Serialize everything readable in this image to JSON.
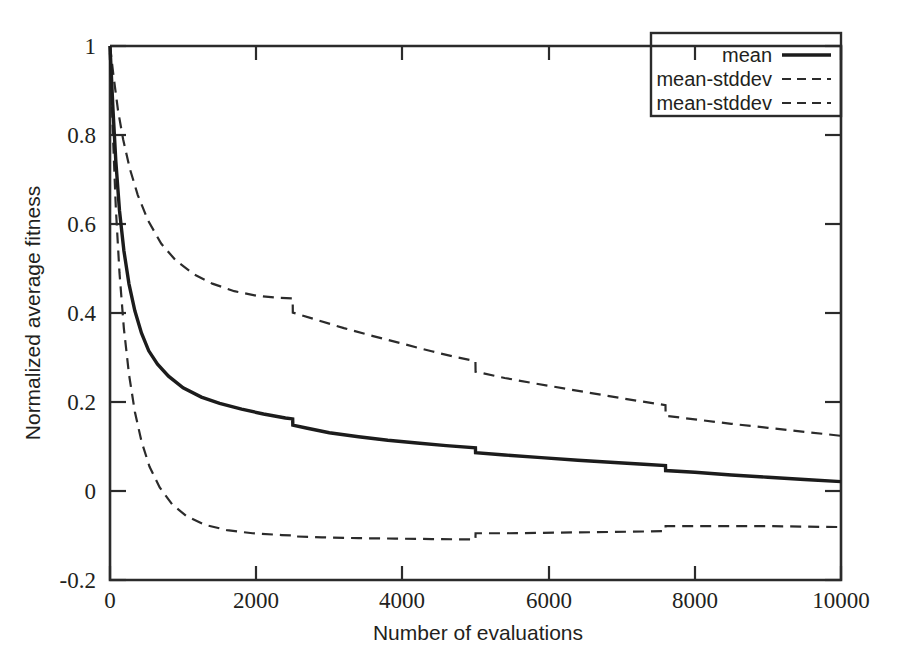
{
  "chart_data": {
    "type": "line",
    "title": "",
    "xlabel": "Number of evaluations",
    "ylabel": "Normalized  average fitness",
    "xlim": [
      0,
      10000
    ],
    "ylim": [
      -0.2,
      1
    ],
    "xticks": [
      0,
      2000,
      4000,
      6000,
      8000,
      10000
    ],
    "xtick_labels": [
      "0",
      "2000",
      "4000",
      "6000",
      "8000",
      "10000"
    ],
    "yticks": [
      -0.2,
      0,
      0.2,
      0.4,
      0.6,
      0.8,
      1
    ],
    "ytick_labels": [
      "-0.2",
      "0",
      "0.2",
      "0.4",
      "0.6",
      "0.8",
      "1"
    ],
    "grid": false,
    "legend_position": "top-right",
    "legend": [
      "mean",
      "mean-stddev",
      "mean-stddev"
    ],
    "series": [
      {
        "name": "mean",
        "style": "solid",
        "x": [
          0,
          40,
          80,
          130,
          190,
          260,
          340,
          430,
          530,
          650,
          800,
          1000,
          1250,
          1500,
          1800,
          2100,
          2400,
          2499,
          2501,
          2700,
          3000,
          3400,
          3800,
          4200,
          4600,
          4999,
          5001,
          5400,
          5900,
          6400,
          6900,
          7300,
          7599,
          7601,
          8000,
          8500,
          9000,
          9500,
          10000
        ],
        "y": [
          1.0,
          0.86,
          0.74,
          0.63,
          0.54,
          0.465,
          0.405,
          0.355,
          0.315,
          0.285,
          0.258,
          0.232,
          0.211,
          0.197,
          0.184,
          0.173,
          0.164,
          0.162,
          0.148,
          0.141,
          0.131,
          0.122,
          0.114,
          0.108,
          0.102,
          0.097,
          0.086,
          0.081,
          0.075,
          0.069,
          0.064,
          0.06,
          0.057,
          0.046,
          0.042,
          0.036,
          0.031,
          0.026,
          0.021
        ]
      },
      {
        "name": "mean-stddev",
        "style": "dashed",
        "x": [
          0,
          50,
          110,
          180,
          270,
          380,
          520,
          700,
          900,
          1150,
          1400,
          1700,
          2000,
          2300,
          2499,
          2501,
          2800,
          3200,
          3600,
          4000,
          4400,
          4700,
          4999,
          5001,
          5400,
          5800,
          6300,
          6800,
          7200,
          7599,
          7601,
          8000,
          8500,
          9000,
          9500,
          10000
        ],
        "y": [
          1.0,
          0.93,
          0.855,
          0.79,
          0.725,
          0.665,
          0.608,
          0.556,
          0.518,
          0.487,
          0.466,
          0.449,
          0.439,
          0.434,
          0.433,
          0.401,
          0.386,
          0.366,
          0.348,
          0.331,
          0.314,
          0.302,
          0.292,
          0.268,
          0.254,
          0.242,
          0.228,
          0.214,
          0.203,
          0.193,
          0.169,
          0.161,
          0.151,
          0.142,
          0.133,
          0.124
        ]
      },
      {
        "name": "mean-stddev",
        "style": "dashed",
        "x": [
          0,
          40,
          80,
          130,
          190,
          260,
          340,
          430,
          540,
          680,
          850,
          1050,
          1300,
          1600,
          1950,
          2350,
          2499,
          2501,
          2900,
          3400,
          3900,
          4400,
          4999,
          5001,
          5400,
          5900,
          6400,
          6900,
          7300,
          7599,
          7601,
          8000,
          8500,
          9000,
          9500,
          10000
        ],
        "y": [
          0.985,
          0.8,
          0.635,
          0.49,
          0.365,
          0.262,
          0.178,
          0.112,
          0.055,
          0.008,
          -0.03,
          -0.057,
          -0.076,
          -0.088,
          -0.095,
          -0.099,
          -0.1,
          -0.102,
          -0.104,
          -0.106,
          -0.107,
          -0.108,
          -0.109,
          -0.095,
          -0.095,
          -0.094,
          -0.093,
          -0.092,
          -0.091,
          -0.09,
          -0.079,
          -0.079,
          -0.079,
          -0.079,
          -0.08,
          -0.081
        ]
      }
    ]
  },
  "axis": {
    "x_title": "Number of evaluations",
    "y_title": "Normalized  average fitness"
  },
  "legend": {
    "entries": [
      {
        "label": "mean",
        "style": "solid"
      },
      {
        "label": "mean-stddev",
        "style": "dashed"
      },
      {
        "label": "mean-stddev",
        "style": "dashed"
      }
    ]
  },
  "colors": {
    "line": "#1c1c1c",
    "frame": "#2b2b2b",
    "background": "#ffffff",
    "text": "#231f20"
  }
}
